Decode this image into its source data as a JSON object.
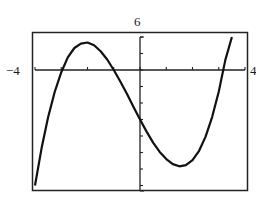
{
  "labels": {
    "ymax": "6",
    "xmin": "−4",
    "xmax": "4"
  },
  "chart_data": {
    "type": "line",
    "title": "",
    "xlabel": "",
    "ylabel": "",
    "xlim": [
      -4,
      4
    ],
    "ylim": [
      -22,
      6
    ],
    "grid": false,
    "x_ticks_every": 1,
    "y_ticks_every": 3,
    "series": [
      {
        "name": "f(x)",
        "x": [
          -4.0,
          -3.75,
          -3.5,
          -3.25,
          -3.0,
          -2.75,
          -2.5,
          -2.25,
          -2.0,
          -1.75,
          -1.5,
          -1.25,
          -1.0,
          -0.75,
          -0.5,
          -0.25,
          0.0,
          0.25,
          0.5,
          0.75,
          1.0,
          1.25,
          1.5,
          1.75,
          2.0,
          2.25,
          2.5,
          2.75,
          3.0,
          3.25,
          3.5
        ],
        "y": [
          -21.0,
          -14.2,
          -8.6,
          -4.0,
          -0.4,
          2.3,
          4.0,
          4.8,
          5.0,
          4.5,
          3.4,
          1.9,
          0.0,
          -2.1,
          -4.3,
          -6.7,
          -9.0,
          -11.2,
          -13.2,
          -14.9,
          -16.2,
          -17.1,
          -17.5,
          -17.3,
          -16.4,
          -14.7,
          -12.1,
          -8.5,
          -3.9,
          1.8,
          6.0
        ]
      }
    ]
  }
}
